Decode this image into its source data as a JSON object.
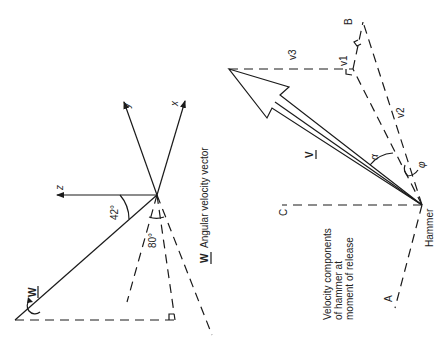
{
  "left_diagram": {
    "axes": {
      "x": "x",
      "y": "y",
      "z": "z"
    },
    "angles": {
      "elevation": "42°",
      "azimuth": "80°"
    },
    "vector_symbol": "W",
    "caption_symbol": "W",
    "caption": "Angular velocity vector"
  },
  "right_diagram": {
    "points": {
      "a": "A",
      "b": "B",
      "c": "C"
    },
    "origin_label": "Hammer",
    "vector_symbol": "V",
    "components": {
      "v1": "v1",
      "v2": "v2",
      "v3": "v3"
    },
    "angles": {
      "alpha": "α",
      "phi": "φ"
    },
    "caption_lines": [
      "Velocity components",
      "of hammer at",
      "moment of release"
    ]
  },
  "colors": {
    "ink": "#1a1a1a",
    "background": "#ffffff"
  }
}
